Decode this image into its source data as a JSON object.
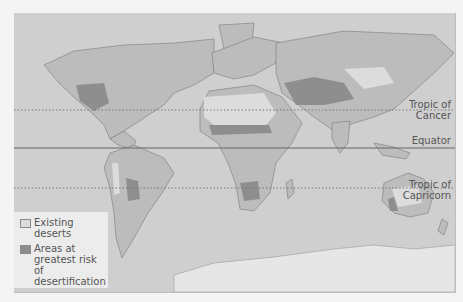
{
  "map": {
    "colors": {
      "ocean": "#cfcfcf",
      "land": "#bcbcbc",
      "existing_deserts": "#dcdcdc",
      "risk_areas": "#8e8e8e",
      "borders": "#7a7a7a",
      "antarctica": "#e6e6e6"
    },
    "lines": [
      {
        "label": "Tropic of Cancer",
        "line1": "Tropic of",
        "line2": "Cancer",
        "style": "dotted"
      },
      {
        "label": "Equator",
        "line1": "Equator",
        "style": "solid"
      },
      {
        "label": "Tropic of Capricorn",
        "line1": "Tropic of",
        "line2": "Capricorn",
        "style": "dotted"
      }
    ],
    "legend": {
      "items": [
        {
          "label_line1": "Existing",
          "label_line2": "deserts",
          "color": "#dcdcdc"
        },
        {
          "label_line1": "Areas at",
          "label_line2": "greatest risk of",
          "label_line3": "desertification",
          "color": "#8e8e8e"
        }
      ]
    }
  }
}
